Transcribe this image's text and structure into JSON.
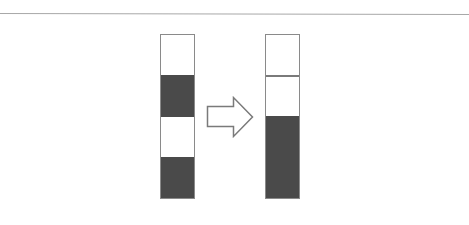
{
  "diagram": {
    "colors": {
      "rule": "#a8a8a8",
      "border": "#8a8a8a",
      "filled": "#4a4a4a",
      "empty": "#ffffff",
      "arrow_stroke": "#7a7a7a"
    },
    "before": {
      "label": "",
      "segments": [
        {
          "state": "empty"
        },
        {
          "state": "filled"
        },
        {
          "state": "empty"
        },
        {
          "state": "filled"
        }
      ]
    },
    "arrow": {
      "direction": "right"
    },
    "after": {
      "label": "",
      "segments": [
        {
          "state": "empty"
        },
        {
          "state": "empty"
        },
        {
          "state": "filled"
        }
      ]
    }
  }
}
